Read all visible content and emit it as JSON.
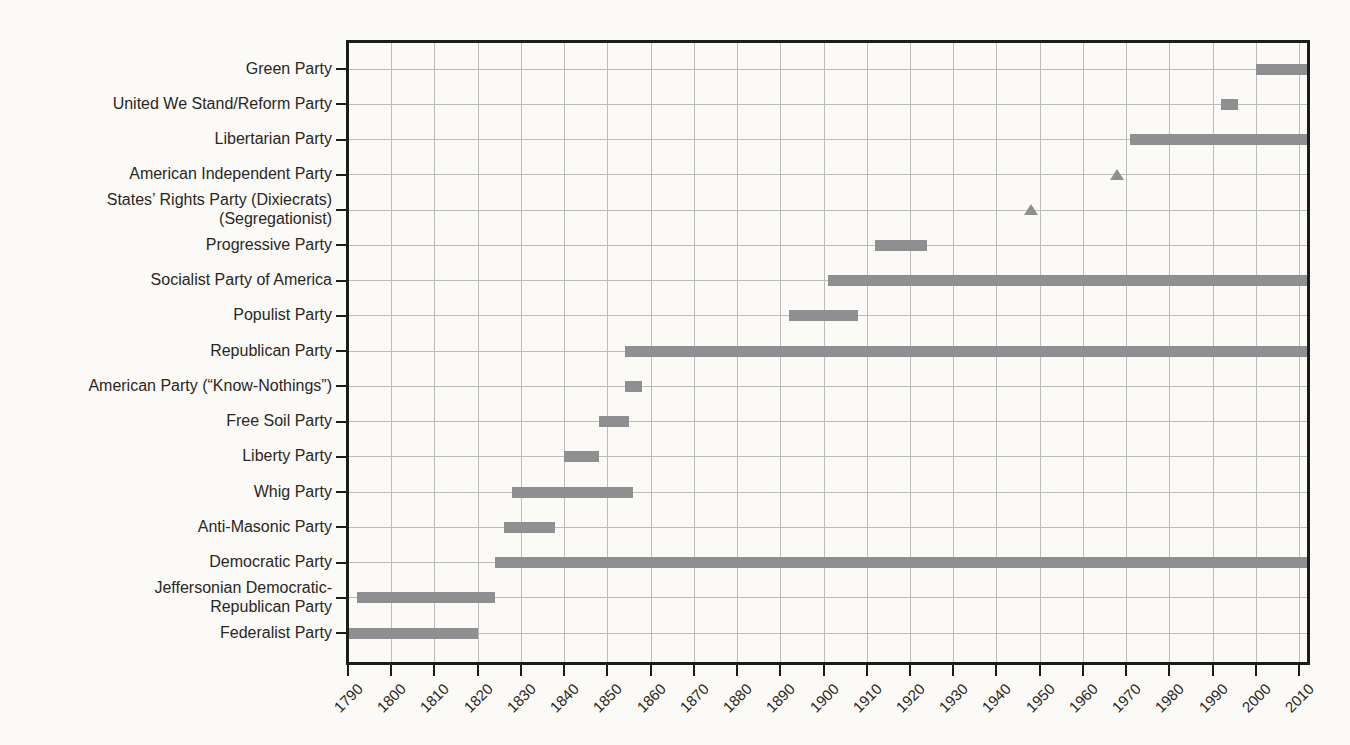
{
  "chart_data": {
    "type": "bar",
    "subtype": "gantt-timeline",
    "title": "",
    "xlabel": "",
    "ylabel": "",
    "x_axis": {
      "min": 1790,
      "max": 2012,
      "tick_step": 10,
      "ticks": [
        1790,
        1800,
        1810,
        1820,
        1830,
        1840,
        1850,
        1860,
        1870,
        1880,
        1890,
        1900,
        1910,
        1920,
        1930,
        1940,
        1950,
        1960,
        1970,
        1980,
        1990,
        2000,
        2010
      ]
    },
    "grid": "both",
    "legend": "none",
    "rows": [
      {
        "label": "Green Party",
        "lines": [
          "Green Party"
        ],
        "type": "bar",
        "start": 2000,
        "end": 2012,
        "to_edge": true
      },
      {
        "label": "United We Stand/Reform Party",
        "lines": [
          "United We Stand/Reform Party"
        ],
        "type": "bar",
        "start": 1992,
        "end": 1996,
        "to_edge": false
      },
      {
        "label": "Libertarian Party",
        "lines": [
          "Libertarian Party"
        ],
        "type": "bar",
        "start": 1971,
        "end": 2012,
        "to_edge": true
      },
      {
        "label": "American Independent Party",
        "lines": [
          "American Independent Party"
        ],
        "type": "marker",
        "marker": "triangle",
        "year": 1968
      },
      {
        "label": "States’ Rights Party (Dixiecrats) (Segregationist)",
        "lines": [
          "States’ Rights Party (Dixiecrats)",
          "(Segregationist)"
        ],
        "type": "marker",
        "marker": "triangle",
        "year": 1948
      },
      {
        "label": "Progressive Party",
        "lines": [
          "Progressive Party"
        ],
        "type": "bar",
        "start": 1912,
        "end": 1924,
        "to_edge": false
      },
      {
        "label": "Socialist Party of America",
        "lines": [
          "Socialist Party of America"
        ],
        "type": "bar",
        "start": 1901,
        "end": 2012,
        "to_edge": true
      },
      {
        "label": "Populist Party",
        "lines": [
          "Populist Party"
        ],
        "type": "bar",
        "start": 1892,
        "end": 1908,
        "to_edge": false
      },
      {
        "label": "Republican Party",
        "lines": [
          "Republican Party"
        ],
        "type": "bar",
        "start": 1854,
        "end": 2012,
        "to_edge": true
      },
      {
        "label": "American Party (“Know-Nothings”)",
        "lines": [
          "American Party (“Know-Nothings”)"
        ],
        "type": "bar",
        "start": 1854,
        "end": 1858,
        "to_edge": false
      },
      {
        "label": "Free Soil Party",
        "lines": [
          "Free Soil Party"
        ],
        "type": "bar",
        "start": 1848,
        "end": 1855,
        "to_edge": false
      },
      {
        "label": "Liberty Party",
        "lines": [
          "Liberty Party"
        ],
        "type": "bar",
        "start": 1840,
        "end": 1848,
        "to_edge": false
      },
      {
        "label": "Whig Party",
        "lines": [
          "Whig Party"
        ],
        "type": "bar",
        "start": 1828,
        "end": 1856,
        "to_edge": false
      },
      {
        "label": "Anti-Masonic Party",
        "lines": [
          "Anti-Masonic Party"
        ],
        "type": "bar",
        "start": 1826,
        "end": 1838,
        "to_edge": false
      },
      {
        "label": "Democratic Party",
        "lines": [
          "Democratic Party"
        ],
        "type": "bar",
        "start": 1824,
        "end": 2012,
        "to_edge": true
      },
      {
        "label": "Jeffersonian Democratic-Republican Party",
        "lines": [
          "Jeffersonian Democratic-",
          "Republican Party"
        ],
        "type": "bar",
        "start": 1792,
        "end": 1824,
        "to_edge": false
      },
      {
        "label": "Federalist Party",
        "lines": [
          "Federalist Party"
        ],
        "type": "bar",
        "start": 1790,
        "end": 1820,
        "to_edge": false
      }
    ],
    "colors": {
      "bar": "#8d8f90",
      "marker": "#8d8f90",
      "grid": "#bcbdba",
      "axis": "#1c1c1c",
      "text": "#2a2724",
      "background": "#fbfaf6"
    }
  }
}
